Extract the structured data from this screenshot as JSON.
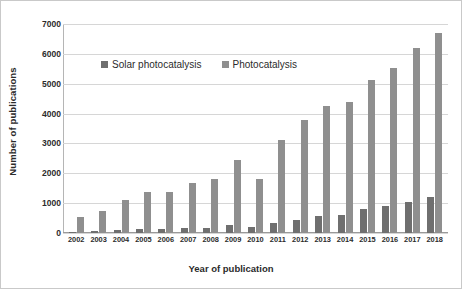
{
  "chart_data": {
    "type": "bar",
    "title": "",
    "xlabel": "Year of publication",
    "ylabel": "Number of publications",
    "categories": [
      "2002",
      "2003",
      "2004",
      "2005",
      "2006",
      "2007",
      "2008",
      "2009",
      "2010",
      "2011",
      "2012",
      "2013",
      "2014",
      "2015",
      "2016",
      "2017",
      "2018"
    ],
    "series": [
      {
        "name": "Solar photocatalysis",
        "color": "#6f6f6f",
        "values": [
          30,
          60,
          100,
          130,
          140,
          170,
          175,
          280,
          210,
          330,
          450,
          570,
          590,
          800,
          900,
          1030,
          1190
        ]
      },
      {
        "name": "Photocatalysis",
        "color": "#8f8f8f",
        "values": [
          520,
          750,
          1120,
          1360,
          1390,
          1660,
          1810,
          2450,
          1810,
          3130,
          3790,
          4240,
          4390,
          5140,
          5530,
          6180,
          6700
        ]
      }
    ],
    "ylim": [
      0,
      7000
    ],
    "yticks": [
      0,
      1000,
      2000,
      3000,
      4000,
      5000,
      6000,
      7000
    ],
    "ytick_labels": [
      "0",
      "1000",
      "2000",
      "3000",
      "4000",
      "5000",
      "6000",
      "7000"
    ],
    "grid": true,
    "legend_position": "upper-left-inside"
  }
}
